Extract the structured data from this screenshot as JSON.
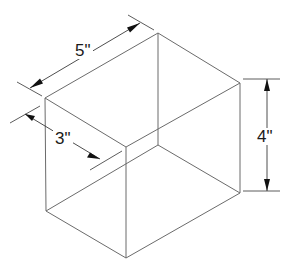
{
  "diagram": {
    "type": "isometric-box-dimension-drawing",
    "line_color": "#6b6b6b",
    "dimension_color": "#111111",
    "background": "#ffffff",
    "dimensions": {
      "length": {
        "label": "5\"",
        "value": 5,
        "unit": "in"
      },
      "width": {
        "label": "3\"",
        "value": 3,
        "unit": "in"
      },
      "height": {
        "label": "4\"",
        "value": 4,
        "unit": "in"
      }
    }
  }
}
